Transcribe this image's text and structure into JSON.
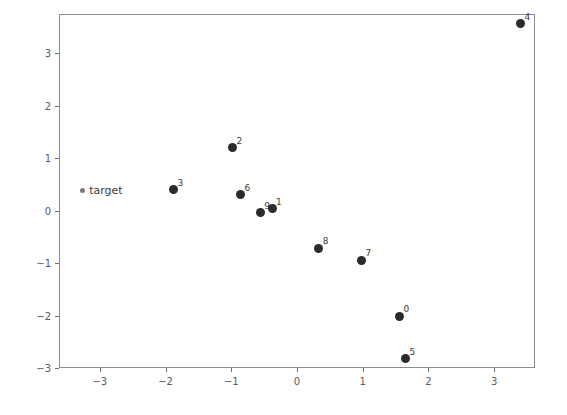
{
  "chart_data": {
    "type": "scatter",
    "title": "",
    "xlabel": "",
    "ylabel": "",
    "xlim": [
      -3.62,
      3.62
    ],
    "ylim": [
      -3.0,
      3.75
    ],
    "grid": false,
    "legend": null,
    "xticks": [
      -3,
      -2,
      -1,
      0,
      1,
      2,
      3
    ],
    "xticklabels": [
      "−3",
      "−2",
      "−1",
      "0",
      "1",
      "2",
      "3"
    ],
    "yticks": [
      -3,
      -2,
      -1,
      0,
      1,
      2,
      3
    ],
    "yticklabels": [
      "−3",
      "−2",
      "−1",
      "0",
      "1",
      "2",
      "3"
    ],
    "annotations": [
      {
        "text": "target",
        "x": -3.16,
        "y": 0.38
      }
    ],
    "points": [
      {
        "label": "",
        "x": -3.26,
        "y": 0.38,
        "style": "small"
      },
      {
        "label": "3",
        "x": -1.88,
        "y": 0.4,
        "style": "filled"
      },
      {
        "label": "2",
        "x": -0.98,
        "y": 1.2,
        "style": "filled"
      },
      {
        "label": "6",
        "x": -0.86,
        "y": 0.3,
        "style": "filled"
      },
      {
        "label": "9",
        "x": -0.56,
        "y": -0.04,
        "style": "filled"
      },
      {
        "label": "1",
        "x": -0.38,
        "y": 0.04,
        "style": "filled"
      },
      {
        "label": "8",
        "x": 0.33,
        "y": -0.72,
        "style": "filled"
      },
      {
        "label": "7",
        "x": 0.98,
        "y": -0.95,
        "style": "filled"
      },
      {
        "label": "0",
        "x": 1.56,
        "y": -2.01,
        "style": "filled"
      },
      {
        "label": "5",
        "x": 1.65,
        "y": -2.82,
        "style": "filled"
      },
      {
        "label": "4",
        "x": 3.4,
        "y": 3.56,
        "style": "filled"
      }
    ]
  },
  "axes": {
    "frame_color": "#8d8d8d",
    "marker_color": "#2b2b2b",
    "background": "#ffffff"
  }
}
